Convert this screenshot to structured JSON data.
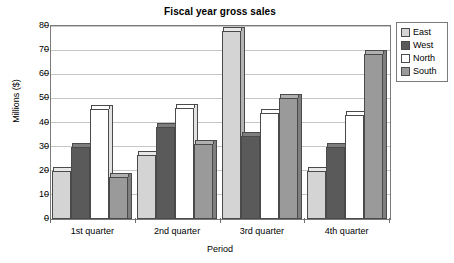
{
  "chart_data": {
    "type": "bar",
    "title": "Fiscal year gross sales",
    "xlabel": "Period",
    "ylabel": "Millions ($)",
    "categories": [
      "1st quarter",
      "2nd quarter",
      "3rd quarter",
      "4th quarter"
    ],
    "series": [
      {
        "name": "East",
        "color": "#d4d4d4",
        "side_color": "#b4b4b4",
        "top_color": "#e8e8e8",
        "values": [
          20,
          26.5,
          78,
          20
        ]
      },
      {
        "name": "West",
        "color": "#5a5a5a",
        "side_color": "#474747",
        "top_color": "#7d7d7d",
        "values": [
          30,
          38,
          34.5,
          30
        ]
      },
      {
        "name": "North",
        "color": "#ffffff",
        "side_color": "#e2e2e2",
        "top_color": "#ffffff",
        "values": [
          45.5,
          46,
          44,
          43
        ]
      },
      {
        "name": "South",
        "color": "#9a9a9a",
        "side_color": "#7f7f7f",
        "top_color": "#b0b0b0",
        "values": [
          17.5,
          31,
          50,
          68.5
        ]
      }
    ],
    "ylim": [
      0,
      80
    ],
    "yticks": [
      0,
      10,
      20,
      30,
      40,
      50,
      60,
      70,
      80
    ],
    "ytick_labels": [
      "0",
      "10",
      "20",
      "30",
      "40",
      "50",
      "60",
      "70",
      "80"
    ],
    "grid": true,
    "legend_position": "right",
    "legend_entries": [
      "East",
      "West",
      "North",
      "South"
    ]
  }
}
